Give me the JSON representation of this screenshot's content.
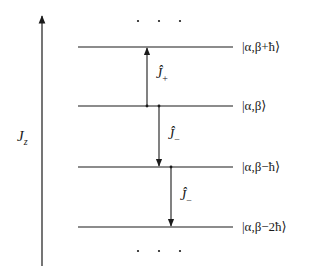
{
  "diagram": {
    "type": "ladder-operator-energy-levels",
    "axis": {
      "label_main": "J",
      "label_sub": "z",
      "direction": "up"
    },
    "levels": [
      {
        "ket": "|α,β+ħ⟩",
        "y": 47
      },
      {
        "ket": "|α,β⟩",
        "y": 106
      },
      {
        "ket": "|α,β−ħ⟩",
        "y": 167
      },
      {
        "ket": "|α,β−2ħ⟩",
        "y": 227
      }
    ],
    "operators": [
      {
        "symbol": "Ĵ",
        "sub": "+",
        "from_level": 1,
        "to_level": 0,
        "direction": "up"
      },
      {
        "symbol": "Ĵ",
        "sub": "−",
        "from_level": 1,
        "to_level": 2,
        "direction": "down"
      },
      {
        "symbol": "Ĵ",
        "sub": "−",
        "from_level": 2,
        "to_level": 3,
        "direction": "down"
      }
    ],
    "ellipsis_top": ". . .",
    "ellipsis_bottom": ". . .",
    "colors": {
      "ink": "#1a1a1a",
      "background": "#ffffff"
    }
  }
}
